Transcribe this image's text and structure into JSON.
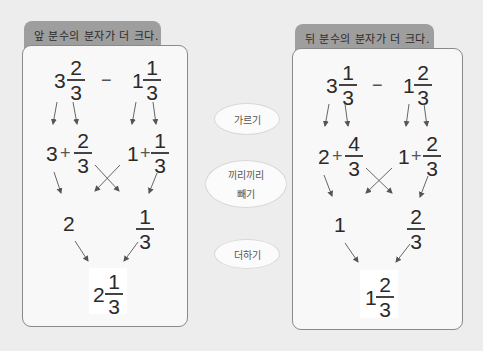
{
  "left": {
    "title": "앞 분수의 분자가 더 크다.",
    "expr": {
      "a_whole": "3",
      "a_num": "2",
      "a_den": "3",
      "op": "−",
      "b_whole": "1",
      "b_num": "1",
      "b_den": "3"
    },
    "split": {
      "a_whole": "3",
      "plus": "+",
      "a_num": "2",
      "a_den": "3",
      "b_whole": "1",
      "b_num": "1",
      "b_den": "3"
    },
    "diff": {
      "whole": "2",
      "num": "1",
      "den": "3"
    },
    "result": {
      "whole": "2",
      "num": "1",
      "den": "3"
    }
  },
  "right": {
    "title": "뒤 분수의 분자가 더 크다.",
    "expr": {
      "a_whole": "3",
      "a_num": "1",
      "a_den": "3",
      "op": "−",
      "b_whole": "1",
      "b_num": "2",
      "b_den": "3"
    },
    "split": {
      "a_whole": "2",
      "plus": "+",
      "a_num": "4",
      "a_den": "3",
      "b_whole": "1",
      "b_num": "2",
      "b_den": "3"
    },
    "diff": {
      "whole": "1",
      "num": "2",
      "den": "3"
    },
    "result": {
      "whole": "1",
      "num": "2",
      "den": "3"
    }
  },
  "steps": [
    {
      "label": "가르기"
    },
    {
      "label": "끼리끼리",
      "label2": "빼기"
    },
    {
      "label": "더하기"
    }
  ]
}
